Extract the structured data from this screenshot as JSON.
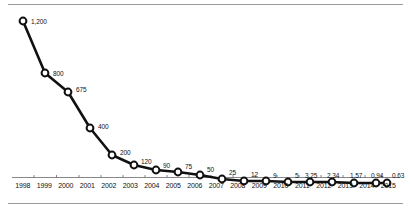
{
  "chart_data": {
    "type": "line",
    "title": "",
    "subtitle": "",
    "xlabel": "",
    "ylabel": "",
    "grid": false,
    "legend": "none",
    "axis_note": "y-axis is unlabeled and visually compressed (log-like); values shown as point data labels",
    "categories": [
      "1998",
      "1999",
      "2000",
      "2001",
      "2002",
      "2003",
      "2004",
      "2005",
      "2006",
      "2007",
      "2008",
      "2009",
      "2010",
      "2011",
      "2012",
      "2013",
      "2014",
      "2015"
    ],
    "values": [
      1200,
      800,
      675,
      400,
      200,
      120,
      90,
      75,
      50,
      25,
      12,
      9,
      5,
      3.25,
      2.34,
      1.57,
      0.94,
      0.63
    ],
    "point_labels": [
      "1,200",
      "800",
      "675",
      "400",
      "200",
      "120",
      "90",
      "75",
      "50",
      "25",
      "12",
      "9",
      "5",
      "3.25",
      "2.34",
      "1.57",
      "0.94",
      "0.63"
    ],
    "xlim": [
      1998,
      2015
    ],
    "points": [
      {
        "year": "1998",
        "label": "1,200",
        "value": 1200,
        "x": 23,
        "y": 21,
        "lx": 31,
        "ly": 21
      },
      {
        "year": "1999",
        "label": "800",
        "value": 800,
        "x": 45,
        "y": 73,
        "lx": 53,
        "ly": 73
      },
      {
        "year": "2000",
        "label": "675",
        "value": 675,
        "x": 68,
        "y": 92,
        "lx": 76,
        "ly": 89
      },
      {
        "year": "2001",
        "label": "400",
        "value": 400,
        "x": 90,
        "y": 128,
        "lx": 98,
        "ly": 126
      },
      {
        "year": "2002",
        "label": "200",
        "value": 200,
        "x": 112,
        "y": 155,
        "lx": 120,
        "ly": 152
      },
      {
        "year": "2003",
        "label": "120",
        "value": 120,
        "x": 134,
        "y": 165,
        "lx": 141,
        "ly": 161
      },
      {
        "year": "2004",
        "label": "90",
        "value": 90,
        "x": 156,
        "y": 170,
        "lx": 163,
        "ly": 165
      },
      {
        "year": "2005",
        "label": "75",
        "value": 75,
        "x": 178,
        "y": 172,
        "lx": 185,
        "ly": 166
      },
      {
        "year": "2006",
        "label": "50",
        "value": 50,
        "x": 200,
        "y": 175,
        "lx": 207,
        "ly": 169
      },
      {
        "year": "2007",
        "label": "25",
        "value": 25,
        "x": 222,
        "y": 179,
        "lx": 229,
        "ly": 172
      },
      {
        "year": "2008",
        "label": "12",
        "value": 12,
        "x": 244,
        "y": 181,
        "lx": 251,
        "ly": 174
      },
      {
        "year": "2009",
        "label": "9",
        "value": 9,
        "x": 266,
        "y": 181,
        "lx": 273,
        "ly": 175
      },
      {
        "year": "2010",
        "label": "5",
        "value": 5,
        "x": 288,
        "y": 182,
        "lx": 295,
        "ly": 175
      },
      {
        "year": "2011",
        "label": "3.25",
        "value": 3.25,
        "x": 310,
        "y": 182,
        "lx": 305,
        "ly": 175
      },
      {
        "year": "2012",
        "label": "2.34",
        "value": 2.34,
        "x": 332,
        "y": 182,
        "lx": 327,
        "ly": 175
      },
      {
        "year": "2013",
        "label": "1.57",
        "value": 1.57,
        "x": 354,
        "y": 183,
        "lx": 350,
        "ly": 175
      },
      {
        "year": "2014",
        "label": "0.94",
        "value": 0.94,
        "x": 376,
        "y": 183,
        "lx": 371,
        "ly": 175
      },
      {
        "year": "2015",
        "label": "0.63",
        "value": 0.63,
        "x": 387,
        "y": 183,
        "lx": 392,
        "ly": 175
      }
    ]
  },
  "axis": {
    "tick_labels": [
      "1998",
      "1999",
      "2000",
      "2001",
      "2002",
      "2003",
      "2004",
      "2005",
      "2006",
      "2007",
      "2008",
      "2009",
      "2010",
      "2011",
      "2012",
      "2013",
      "2014",
      "2015"
    ]
  },
  "colors": {
    "line": "#111111",
    "marker_fill": "#ffffff",
    "marker_stroke": "#111111",
    "rule": "#9a9a9a",
    "axis": "#555555",
    "text": "#111111"
  }
}
